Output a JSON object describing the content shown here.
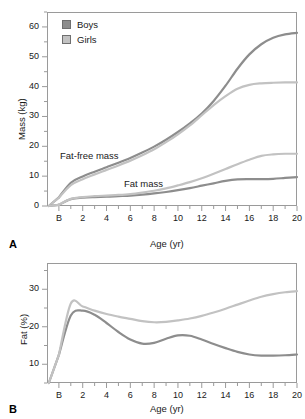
{
  "figure": {
    "panels": [
      {
        "letter": "A",
        "ylabel": "Mass (kg)",
        "xlabel": "Age (yr)",
        "annotations": [
          {
            "text": "Fat-free mass"
          },
          {
            "text": "Fat mass"
          }
        ]
      },
      {
        "letter": "B",
        "ylabel": "Fat (%)",
        "xlabel": "Age (yr)"
      }
    ]
  },
  "legend": {
    "position": "top-left",
    "items": [
      {
        "label": "Boys",
        "color": "#8d8d8d"
      },
      {
        "label": "Girls",
        "color": "#c2c2c2"
      }
    ]
  },
  "colors": {
    "boys": "#8d8d8d",
    "girls": "#c2c2c2",
    "axis": "#9a9a9a",
    "text": "#1a1a1a"
  },
  "chart_data": [
    {
      "type": "line",
      "panel": "A",
      "title": "",
      "xlabel": "Age (yr)",
      "ylabel": "Mass (kg)",
      "xlim": [
        -1.0,
        20.0
      ],
      "ylim": [
        0,
        65
      ],
      "yticks": [
        0,
        10,
        20,
        30,
        40,
        50,
        60
      ],
      "yticklabels": [
        "0",
        "10",
        "20",
        "30",
        "40",
        "50",
        "60"
      ],
      "yminorstep": 5,
      "xticks": [
        0,
        2,
        4,
        6,
        8,
        10,
        12,
        14,
        16,
        18,
        20
      ],
      "xticklabels": [
        "B",
        "2",
        "4",
        "6",
        "8",
        "10",
        "12",
        "14",
        "16",
        "18",
        "20"
      ],
      "xminorstep": 1,
      "grid": false,
      "legend_position": "upper left",
      "x": [
        0,
        1,
        2,
        3,
        4,
        5,
        6,
        7,
        8,
        9,
        10,
        11,
        12,
        13,
        14,
        15,
        16,
        17,
        18,
        19,
        20
      ],
      "series": [
        {
          "name": "Boys fat-free mass",
          "color": "#8d8d8d",
          "values": [
            2.9,
            7.8,
            9.9,
            11.5,
            13.0,
            14.5,
            16.1,
            17.9,
            19.9,
            22.2,
            24.8,
            27.7,
            31.0,
            35.2,
            40.3,
            46.0,
            50.8,
            54.2,
            56.4,
            57.5,
            58.0
          ]
        },
        {
          "name": "Girls fat-free mass",
          "color": "#c2c2c2",
          "values": [
            2.8,
            7.0,
            9.0,
            10.6,
            12.1,
            13.6,
            15.2,
            17.0,
            19.0,
            21.4,
            24.0,
            27.0,
            30.4,
            33.8,
            36.8,
            39.3,
            40.6,
            41.1,
            41.3,
            41.4,
            41.4
          ]
        },
        {
          "name": "Boys fat mass",
          "color": "#8d8d8d",
          "values": [
            0.4,
            2.3,
            2.8,
            3.0,
            3.1,
            3.3,
            3.5,
            3.8,
            4.2,
            4.7,
            5.3,
            6.0,
            6.8,
            7.6,
            8.4,
            8.9,
            9.0,
            9.0,
            9.1,
            9.4,
            9.7
          ]
        },
        {
          "name": "Girls fat mass",
          "color": "#c2c2c2",
          "values": [
            0.4,
            2.4,
            3.0,
            3.3,
            3.5,
            3.7,
            4.0,
            4.5,
            5.1,
            5.9,
            6.9,
            8.0,
            9.3,
            10.8,
            12.4,
            14.0,
            15.5,
            16.8,
            17.3,
            17.5,
            17.5
          ]
        }
      ]
    },
    {
      "type": "line",
      "panel": "B",
      "title": "",
      "xlabel": "Age (yr)",
      "ylabel": "Fat (%)",
      "xlim": [
        -1.0,
        20.0
      ],
      "ylim": [
        5,
        37
      ],
      "yticks": [
        10,
        20,
        30
      ],
      "yticklabels": [
        "10",
        "20",
        "30"
      ],
      "yminorstep": 5,
      "xticks": [
        0,
        2,
        4,
        6,
        8,
        10,
        12,
        14,
        16,
        18,
        20
      ],
      "xticklabels": [
        "B",
        "2",
        "4",
        "6",
        "8",
        "10",
        "12",
        "14",
        "16",
        "18",
        "20"
      ],
      "xminorstep": 1,
      "grid": false,
      "x": [
        0,
        1,
        2,
        3,
        4,
        5,
        6,
        7,
        8,
        9,
        10,
        11,
        12,
        13,
        14,
        15,
        16,
        17,
        18,
        19,
        20
      ],
      "series": [
        {
          "name": "Boys",
          "color": "#8d8d8d",
          "values": [
            12.5,
            23.0,
            24.3,
            23.2,
            21.0,
            18.6,
            16.6,
            15.5,
            15.7,
            16.8,
            17.7,
            17.6,
            16.6,
            15.4,
            14.3,
            13.3,
            12.6,
            12.3,
            12.3,
            12.4,
            12.6
          ]
        },
        {
          "name": "Girls",
          "color": "#c2c2c2",
          "values": [
            12.5,
            26.2,
            25.4,
            24.3,
            23.4,
            22.7,
            22.1,
            21.5,
            21.2,
            21.3,
            21.7,
            22.2,
            22.9,
            23.8,
            24.8,
            25.9,
            27.0,
            28.0,
            28.7,
            29.2,
            29.5
          ]
        }
      ]
    }
  ]
}
